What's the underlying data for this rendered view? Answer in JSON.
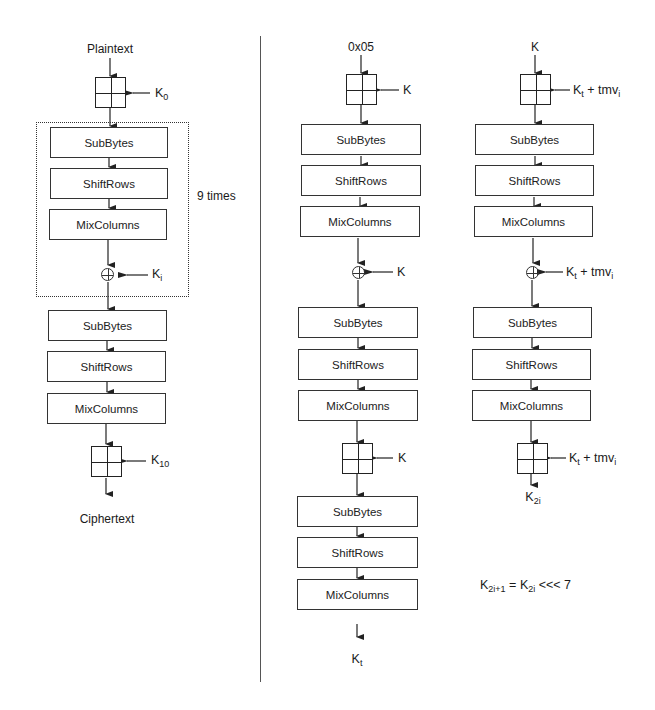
{
  "aes_encryption": {
    "input_label": "Plaintext",
    "initial_key": {
      "base": "K",
      "sub": "0"
    },
    "round_steps": [
      "SubBytes",
      "ShiftRows",
      "MixColumns"
    ],
    "round_key": {
      "base": "K",
      "sub": "i"
    },
    "repeat_label": "9 times",
    "final_steps": [
      "SubBytes",
      "ShiftRows",
      "MixColumns"
    ],
    "final_key": {
      "base": "K",
      "sub": "10"
    },
    "output_label": "Ciphertext"
  },
  "kt_derivation": {
    "input_label": "0x05",
    "key1": "K",
    "steps1": [
      "SubBytes",
      "ShiftRows",
      "MixColumns"
    ],
    "key2": "K",
    "steps2": [
      "SubBytes",
      "ShiftRows",
      "MixColumns"
    ],
    "key3": "K",
    "steps3": [
      "SubBytes",
      "ShiftRows",
      "MixColumns"
    ],
    "output": {
      "base": "K",
      "sub": "t"
    }
  },
  "k2i_derivation": {
    "input_label": "K",
    "key_label": {
      "base": "K",
      "sub": "t",
      "plus": " + tmv",
      "plus_sub": "i"
    },
    "steps1": [
      "SubBytes",
      "ShiftRows",
      "MixColumns"
    ],
    "steps2": [
      "SubBytes",
      "ShiftRows",
      "MixColumns"
    ],
    "output": {
      "base": "K",
      "sub": "2i"
    }
  },
  "formula": {
    "lhs_base": "K",
    "lhs_sub": "2i+1",
    "eq": " = ",
    "rhs_base": "K",
    "rhs_sub": "2i",
    "op": " <<< 7"
  }
}
